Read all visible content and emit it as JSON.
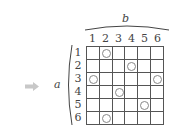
{
  "diagram": {
    "arrow_icon": "right-arrow-icon",
    "row_variable": "a",
    "column_variable": "b",
    "column_labels": [
      "1",
      "2",
      "3",
      "4",
      "5",
      "6"
    ],
    "row_labels": [
      "1",
      "2",
      "3",
      "4",
      "5",
      "6"
    ],
    "marker_symbol": "circle",
    "marked_cells": [
      {
        "row": 1,
        "col": 2
      },
      {
        "row": 2,
        "col": 4
      },
      {
        "row": 3,
        "col": 1
      },
      {
        "row": 3,
        "col": 6
      },
      {
        "row": 4,
        "col": 3
      },
      {
        "row": 5,
        "col": 5
      },
      {
        "row": 6,
        "col": 2
      }
    ],
    "colors": {
      "arrow": "#c8c8c8",
      "grid_line": "#555555",
      "marker": "#888888"
    }
  }
}
